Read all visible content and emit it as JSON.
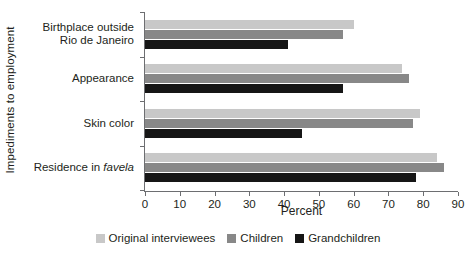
{
  "chart_data": {
    "type": "bar",
    "orientation": "horizontal",
    "title": "",
    "xlabel": "Percent",
    "ylabel": "Impediments to employment",
    "xlim": [
      0,
      90
    ],
    "xticks": [
      0,
      10,
      20,
      30,
      40,
      50,
      60,
      70,
      80,
      90
    ],
    "xtick_labels": [
      "0",
      "10",
      "20",
      "30",
      "40",
      "50",
      "60",
      "70",
      "80",
      "90"
    ],
    "grid": false,
    "legend_position": "bottom",
    "categories": [
      "Birthplace outside\nRio de Janeiro",
      "Appearance",
      "Skin color",
      "Residence in favela"
    ],
    "series": [
      {
        "name": "Original interviewees",
        "color": "#c8c8c8",
        "values": [
          60,
          74,
          79,
          84
        ]
      },
      {
        "name": "Children",
        "color": "#888888",
        "values": [
          57,
          76,
          77,
          86
        ]
      },
      {
        "name": "Grandchildren",
        "color": "#161616",
        "values": [
          41,
          57,
          45,
          78
        ]
      }
    ]
  },
  "axis": {
    "y_title": "Impediments to employment",
    "x_title": "Percent"
  },
  "legend": {
    "items": [
      {
        "label": "Original interviewees",
        "swatch": "s0"
      },
      {
        "label": "Children",
        "swatch": "s1"
      },
      {
        "label": "Grandchildren",
        "swatch": "s2"
      }
    ]
  },
  "colors": {
    "series_light": "#c8c8c8",
    "series_medium": "#888888",
    "series_dark": "#161616",
    "axis": "#6d6e71",
    "text": "#231f20"
  }
}
